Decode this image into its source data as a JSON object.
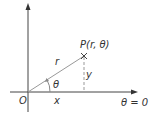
{
  "diagram": {
    "type": "polar-coordinates",
    "colors": {
      "axis": "#444444",
      "radius": "#999999",
      "dashed": "#999999",
      "text": "#333333",
      "background": "#ffffff"
    },
    "labels": {
      "origin": "O",
      "point": "P(r, θ)",
      "radius": "r",
      "angle": "θ",
      "x": "x",
      "y": "y",
      "polar_axis": "θ = 0"
    },
    "icons": {
      "point_marker": "cross-marker"
    }
  }
}
